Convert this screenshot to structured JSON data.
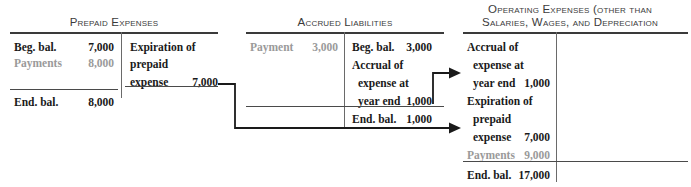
{
  "figure": {
    "kind": "t-account-diagram",
    "accounts": [
      {
        "id": "prepaid-expenses",
        "title": "Prepaid Expenses",
        "left_rows": [
          {
            "label": "Beg. bal.",
            "amount": "7,000",
            "muted": false
          },
          {
            "label": "Payments",
            "amount": "8,000",
            "muted": true
          }
        ],
        "right_rows": [
          {
            "label": "Expiration of",
            "amount": "",
            "muted": false
          },
          {
            "label": "prepaid",
            "amount": "",
            "muted": false
          },
          {
            "label": "expense",
            "amount": "7,000",
            "muted": false
          }
        ],
        "ending": {
          "label": "End. bal.",
          "amount": "8,000",
          "side": "left"
        }
      },
      {
        "id": "accrued-liabilities",
        "title": "Accrued Liabilities",
        "left_rows": [
          {
            "label": "Payment",
            "amount": "3,000",
            "muted": true
          }
        ],
        "right_rows": [
          {
            "label": "Beg. bal.",
            "amount": "3,000",
            "muted": false
          },
          {
            "label": "Accrual of",
            "amount": "",
            "muted": false
          },
          {
            "label": "expense at",
            "amount": "",
            "muted": false
          },
          {
            "label": "year end",
            "amount": "1,000",
            "muted": false
          }
        ],
        "ending": {
          "label": "End. bal.",
          "amount": "1,000",
          "side": "right"
        }
      },
      {
        "id": "operating-expenses",
        "title_line1": "Operating Expenses (other than",
        "title_line2": "Salaries, Wages, and Depreciation",
        "left_rows": [
          {
            "label": "Accrual of",
            "amount": "",
            "muted": false
          },
          {
            "label": "expense at",
            "amount": "",
            "muted": false
          },
          {
            "label": "year end",
            "amount": "1,000",
            "muted": false
          },
          {
            "label": "Expiration of",
            "amount": "",
            "muted": false
          },
          {
            "label": "prepaid",
            "amount": "",
            "muted": false
          },
          {
            "label": "expense",
            "amount": "7,000",
            "muted": false
          },
          {
            "label": "Payments",
            "amount": "9,000",
            "muted": true
          }
        ],
        "right_rows": [],
        "ending": {
          "label": "End. bal.",
          "amount": "17,000",
          "side": "left"
        }
      }
    ],
    "connectors": [
      {
        "id": "prepaid-to-operating",
        "from": "prepaid expense 7,000",
        "to": "operating expenses expiration of prepaid expense 7,000"
      },
      {
        "id": "accrued-to-operating",
        "from": "accrued liabilities year end 1,000",
        "to": "operating expenses accrual of expense at year end 1,000"
      }
    ],
    "colors": {
      "ink": "#1a1a1a",
      "muted": "#9a9a9a",
      "rule": "#4a4a4a",
      "title": "#3b3b3b"
    }
  }
}
